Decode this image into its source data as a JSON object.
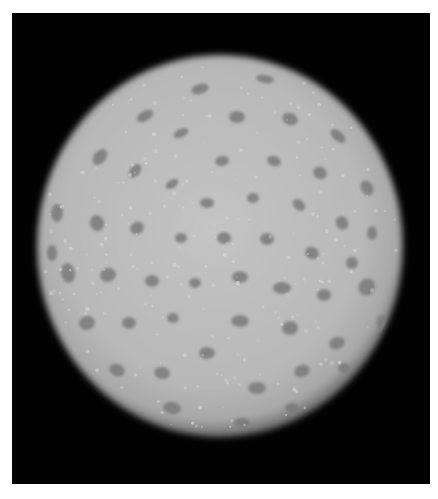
{
  "image": {
    "subject": "pollen-grain-micrograph",
    "description": "Grayscale light micrograph of a spherical pollen grain with many evenly distributed dark pores on a light reticulate surface, on a black background",
    "colors": {
      "background": "#020202",
      "surface": "#b9b9b9",
      "surface_highlight": "#d6d6d6",
      "pore": "#7a7a7a",
      "page": "#ffffff"
    },
    "pore_count_visible": 60
  }
}
